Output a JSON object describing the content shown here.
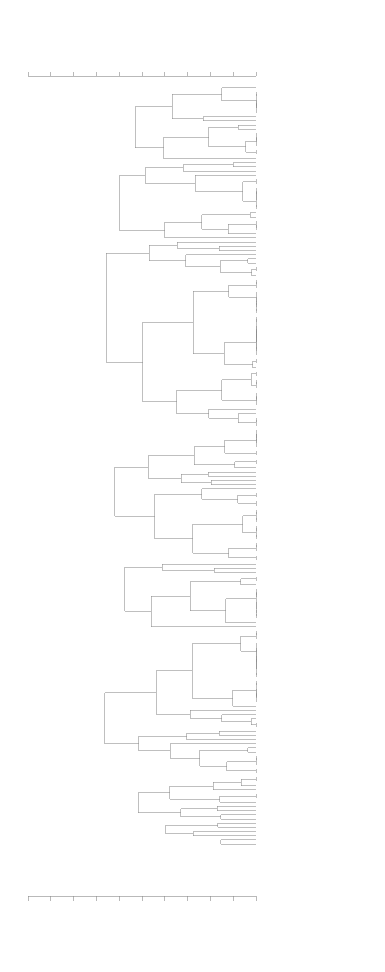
{
  "figure": {
    "type": "dendrogram",
    "orientation": "horizontal-leaves-right",
    "linkage_label": "similarity",
    "leaf_count": 190,
    "cluster_count": 8
  },
  "axis": {
    "position_top": true,
    "position_bottom": true,
    "tick_labels": [
      ".50",
      ".55",
      ".60",
      ".65",
      ".70",
      ".75",
      ".80",
      ".85",
      ".90",
      ".95",
      "1.00"
    ],
    "tick_values": [
      0.5,
      0.55,
      0.6,
      0.65,
      0.7,
      0.75,
      0.8,
      0.85,
      0.9,
      0.95,
      1.0
    ],
    "min": 0.5,
    "max": 1.0,
    "rotated_labels": true
  },
  "clusters": [
    {
      "number": "1",
      "start_leaf": 0,
      "end_leaf": 17
    },
    {
      "number": "2",
      "start_leaf": 18,
      "end_leaf": 36
    },
    {
      "number": "3",
      "start_leaf": 37,
      "end_leaf": 81
    },
    {
      "number": "4",
      "start_leaf": 82,
      "end_leaf": 113
    },
    {
      "number": "5",
      "start_leaf": 114,
      "end_leaf": 129
    },
    {
      "number": "6",
      "start_leaf": 130,
      "end_leaf": 164
    },
    {
      "number": "7",
      "start_leaf": 165,
      "end_leaf": 175
    },
    {
      "number": "8",
      "start_leaf": 176,
      "end_leaf": 189
    }
  ],
  "leaves": [
    "78 TUBATULABAL",
    "72 A. M. MONO",
    "71 S. J. MONO",
    "82 KAWAIISU",
    "81 OWENS VALLEY",
    "83 PANAMINT",
    "85 N. MINOK",
    "88 C. MINOK",
    "86 E. MINOK",
    "89 S. SIERRAN",
    "87 N. SIERRAN",
    "92 F. MIWOK",
    "91 MIWOK",
    "53 CHUKCHANSI YOKUTS",
    "54 N. FOOTHILL YOKUTS",
    "51 KAWEAH YOKUTS",
    "52 LAKE YOKUTS",
    "56 VALLEY YOKUTS",
    "7 N. E. POMO",
    "8 N. E. POMO",
    "6 N. POMO",
    "4 C. POMO",
    "9 S. E. POMO",
    "5 E. POMO",
    "3 S. POMO",
    "11 WAPPO",
    "12 COAST MIWOK",
    "14 LAKE MIWOK",
    "10 PATWIN",
    "16 NOMLAKI",
    "15 WINTU",
    "17 YUKI",
    "18 HUCHNOM",
    "19 COAST YUKI",
    "20 KATO",
    "21 WAILAKI",
    "22 SINKYONE",
    "61 C. TUBI",
    "60 NISENAN",
    "58 SHAI-YOKU",
    "28 HUPA",
    "27 MATTOLE",
    "26 WIYOT",
    "29 KAROK",
    "30 YUROK",
    "25 TOLOWA",
    "31 YUROK",
    "32 CHETCO",
    "34 GALLICE CREEK",
    "38 SIUSLAW",
    "39 KALAPUYA",
    "41 MOLALLA",
    "40 TAKELMA",
    "33 KLAMATH",
    "43 UMPQUA",
    "44 LOWER UMPQUA",
    "36 L. FRASER",
    "35 C. KLALLAM",
    "37 QUILEUTE",
    "45 CHINOOK",
    "46 TILLAMOOK",
    "47 CHEHALIS",
    "48 QUINAULT",
    "49 SQUAXIN",
    "50 NISQUALLY",
    "55 KLALLAM",
    "57 SNOQUALMIE",
    "62 ALSEA",
    "63 SIUSLAW",
    "64 COOS",
    "65 SAHAPTIN",
    "66 YAKIMA",
    "67 WANAPUM",
    "68 NEZ PERCE",
    "69 COLUMBIA",
    "70 KLIKITAT",
    "73 WALLA WALLA",
    "74 UMATILLA",
    "75 CAYUSE",
    "76 PALOUSE",
    "77 WENATCHEE",
    "79 METHOW",
    "80 SANPOIL",
    "84 OKANAGAN",
    "90 COLVILLE",
    "93 SPOKANE",
    "94 KALISPEL",
    "95 KLAMATH KATIMIN",
    "96 ELIZABETH",
    "97 MODOC",
    "98 TENINO",
    "99 UMATILLA",
    "100 KLIKITAT",
    "101 WISHRAM",
    "102 WASCO",
    "103 SAHAPTIN",
    "104 THOMPSON",
    "105 LILLOOET",
    "106 SHUSWAP",
    "107 OKANAGAN",
    "108 COLVILLE",
    "109 LAKES",
    "110 KALISPEL",
    "111 FLATHEAD",
    "112 COEUR D'ALENE",
    "113 NEZ PERCE",
    "114 NICOLA",
    "115 CHILCOTIN",
    "116 CARRIER",
    "117 SEKANI",
    "118 BEAVER",
    "119 SLAVEY",
    "120 DOGRIB",
    "121 CHIPEWYAN",
    "122 HARE",
    "123 KUTCHIN",
    "124 HAN",
    "125 TANANA",
    "126 TANAINA",
    "127 INGALIK",
    "128 KOYUKON",
    "129 AHTNA",
    "130 EYAK",
    "131 TLINGIT",
    "132 HAIDA",
    "133 TSIMSHIAN",
    "134 WAKASHAN",
    "135 NOOTKA",
    "136 KWAKIUTL",
    "137 BELLA COOLA",
    "138 HEILTSUK",
    "139 HAISLA",
    "140 COMOX",
    "141 SECHELT",
    "142 SQUAMISH",
    "143 HALKOMELEM",
    "144 NOOKSACK",
    "145 LUMMI",
    "146 SAMISH",
    "147 SWINOMISH",
    "148 SKAGIT",
    "149 SNOHOMISH",
    "150 PUYALLUP",
    "151 NISQUALLY",
    "152 TWANA",
    "153 CHEHALIS",
    "154 COWLITZ",
    "155 KWALHIOQUA",
    "156 CLATSKANIE",
    "157 CHINOOK",
    "158 CATHLAMET",
    "159 CLACKAMAS",
    "160 MULTNOMAH",
    "161 WASCO",
    "162 WISHRAM",
    "163 TENINO",
    "164 JOHN DAY",
    "165 CAYUSE",
    "166 MOLALLA",
    "167 KALAPUYA",
    "168 YONCALLA",
    "169 UMPQUA",
    "170 COQUILLE",
    "171 COOS",
    "172 SIUSLAW",
    "173 ALSEA",
    "174 TILLAMOOK",
    "175 NESTUCCA",
    "176 SILETZ",
    "177 YAQUINA",
    "178 LUCKIAMUTE",
    "179 SANTIAM",
    "180 PUDDING",
    "181 AHANTCHUYUK",
    "182 TUALATIN",
    "183 ATFALATI",
    "184 CHELAMELA",
    "185 CHEPENAFA",
    "186 CALAPOOYA",
    "187 MOHAWK",
    "188 WINEFELLY",
    "189 MARYS RIVER"
  ]
}
